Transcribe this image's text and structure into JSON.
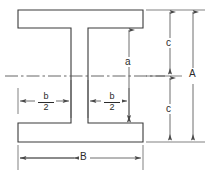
{
  "drawing": {
    "title": "I-beam cross-section dimension diagram",
    "colors": {
      "outline": "#3a3a3a",
      "dimension": "#4a4a4a",
      "centerline": "#555555",
      "text": "#2b2b2b",
      "background": "#ffffff"
    },
    "shape": {
      "name": "I-beam",
      "flange_left": 18,
      "flange_right": 143,
      "web_left": 71,
      "web_right": 88,
      "top": 10,
      "bottom": 142,
      "top_flange_bottom": 28,
      "bottom_flange_top": 123,
      "centerline_y": 76
    }
  },
  "labels": {
    "overall_height": "A",
    "overall_width": "B",
    "web_height": "a",
    "half_height_top": "c",
    "half_height_bottom": "c",
    "half_width_left_numerator": "b",
    "half_width_left_denominator": "2",
    "half_width_right_numerator": "b",
    "half_width_right_denominator": "2"
  },
  "dimensions": [
    {
      "name": "A",
      "label": "A",
      "orientation": "vertical",
      "description": "overall beam height"
    },
    {
      "name": "B",
      "label": "B",
      "orientation": "horizontal",
      "description": "overall flange width"
    },
    {
      "name": "a",
      "label": "a",
      "orientation": "vertical",
      "description": "clear web height between flanges"
    },
    {
      "name": "c-top",
      "label": "c",
      "orientation": "vertical",
      "description": "half height above centerline"
    },
    {
      "name": "c-bottom",
      "label": "c",
      "orientation": "vertical",
      "description": "half height below centerline"
    },
    {
      "name": "b-over-2-left",
      "label": "b/2",
      "orientation": "horizontal",
      "description": "half width left of web"
    },
    {
      "name": "b-over-2-right",
      "label": "b/2",
      "orientation": "horizontal",
      "description": "half width right of web"
    }
  ]
}
